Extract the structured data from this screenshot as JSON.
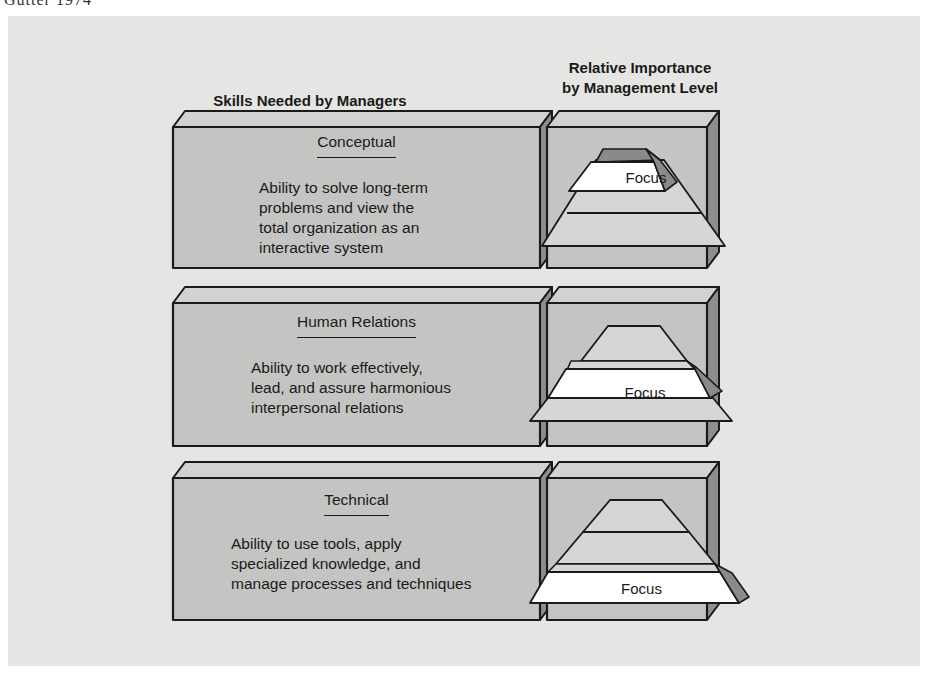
{
  "caption_cut": "Gutter 1974",
  "headers": {
    "left": "Skills Needed by Managers",
    "right_line1": "Relative Importance",
    "right_line2": "by Management Level"
  },
  "skills": [
    {
      "title": "Conceptual",
      "description": [
        "Ability to solve long-term",
        "problems and view the",
        "total organization as an",
        "interactive system"
      ],
      "focus_level": "top",
      "focus_label": "Focus"
    },
    {
      "title": "Human Relations",
      "description": [
        "Ability to work effectively,",
        "lead, and assure harmonious",
        "interpersonal relations"
      ],
      "focus_level": "middle",
      "focus_label": "Focus"
    },
    {
      "title": "Technical",
      "description": [
        "Ability to use tools, apply",
        "specialized knowledge, and",
        "manage processes and techniques"
      ],
      "focus_level": "bottom",
      "focus_label": "Focus"
    }
  ],
  "colors": {
    "panel": "#e5e5e3",
    "box_face": "#c4c4c2",
    "box_top": "#d2d2d0",
    "box_side": "#8e8e8c",
    "pyramid": "#d6d6d4",
    "focus_fill": "#ffffff",
    "focus_side": "#8a8a88",
    "outline": "#1a1a1a"
  }
}
